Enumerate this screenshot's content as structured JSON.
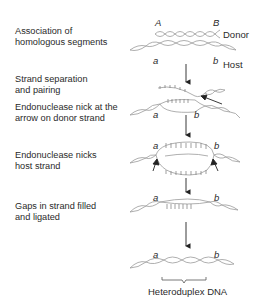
{
  "steps": [
    {
      "line1": "Association of",
      "line2": "homologous segments"
    },
    {
      "line1": "Strand separation",
      "line2": "and pairing"
    },
    {
      "line1": "Endonuclease nick at the",
      "line2": "arrow on donor strand"
    },
    {
      "line1": "Endonuclease nicks",
      "line2": "host strand"
    },
    {
      "line1": "Gaps in strand filled",
      "line2": "and ligated"
    }
  ],
  "labels": {
    "donor_upper_left": "A",
    "donor_upper_right": "B",
    "host_lower_left": "a",
    "host_lower_right": "b",
    "donor": "Donor",
    "host": "Host",
    "heteroduplex": "Heteroduplex DNA"
  },
  "colors": {
    "strand": "#9a9a9a",
    "arrow": "#222222",
    "text": "#2a2a2a"
  }
}
